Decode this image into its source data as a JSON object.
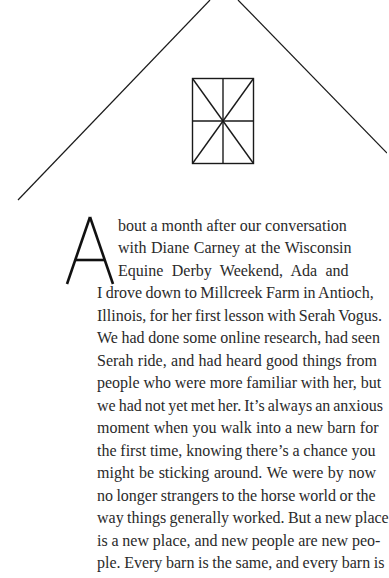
{
  "illustration": {
    "subject": "barn-gable",
    "roof_left": {
      "x1": 18,
      "y1": 200,
      "x2": 210,
      "y2": 0
    },
    "roof_right": {
      "x1": 238,
      "y1": 0,
      "x2": 387,
      "y2": 153
    },
    "window": {
      "x": 192,
      "y": 78,
      "width": 62,
      "height": 85
    },
    "stroke_color": "#1a1a1a"
  },
  "body": {
    "drop_cap": "A",
    "lines": [
      "bout a month after our conversation",
      "with Diane Carney at the Wisconsin",
      "Equine Derby Weekend, Ada and",
      "I drove down to Millcreek Farm in Antioch,",
      "Illinois, for her first lesson with Serah Vogus.",
      "We had done some online research, had seen",
      "Serah ride, and had heard good things from",
      "people who were more familiar with her, but",
      "we had not yet met her. It’s always an anxious",
      "moment when you walk into a new barn for",
      "the first time, knowing there’s a chance you",
      "might be sticking around. We were by now",
      "no longer strangers to the horse world or the",
      "way things generally worked. But a new place",
      "is a new place, and new people are new peo-",
      "ple. Every barn is the same, and every barn is"
    ]
  }
}
